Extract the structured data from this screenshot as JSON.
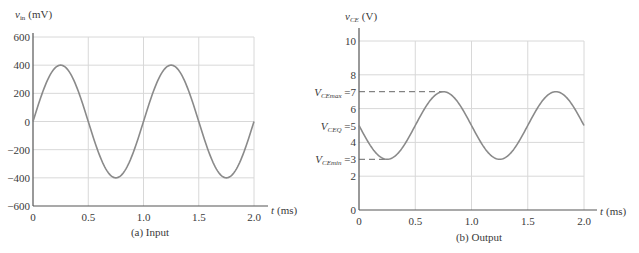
{
  "chart_data": [
    {
      "type": "line",
      "caption": "(a) Input",
      "ylabel": "v_in (mV)",
      "ylabel_main": "v",
      "ylabel_sub": "in",
      "ylabel_unit": "(mV)",
      "xlabel": "t (ms)",
      "xlabel_var": "t",
      "xlabel_unit": "(ms)",
      "xlim": [
        0,
        2.0
      ],
      "ylim": [
        -600,
        600
      ],
      "xticks": [
        "0",
        "0.5",
        "1.0",
        "1.5",
        "2.0"
      ],
      "yticks": [
        "600",
        "400",
        "200",
        "0",
        "−200",
        "−400",
        "−600"
      ],
      "grid": true,
      "series": [
        {
          "name": "v_in",
          "function": "400*sin(2*pi*t/1.0)",
          "amplitude": 400,
          "offset": 0,
          "period_ms": 1.0,
          "x": [
            0,
            0.25,
            0.5,
            0.75,
            1.0,
            1.25,
            1.5,
            1.75,
            2.0
          ],
          "y": [
            0,
            400,
            0,
            -400,
            0,
            400,
            0,
            -400,
            0
          ]
        }
      ]
    },
    {
      "type": "line",
      "caption": "(b) Output",
      "ylabel": "v_CE (V)",
      "ylabel_main": "v",
      "ylabel_sub": "CE",
      "ylabel_unit": "(V)",
      "xlabel": "t (ms)",
      "xlabel_var": "t",
      "xlabel_unit": "(ms)",
      "xlim": [
        0,
        2.0
      ],
      "ylim": [
        0,
        10
      ],
      "xticks": [
        "0",
        "0.5",
        "1.0",
        "1.5",
        "2.0"
      ],
      "yticks": [
        "10",
        "8",
        "6",
        "4",
        "2",
        "0"
      ],
      "grid": true,
      "annotations": [
        {
          "label": "V_CEmax = 7",
          "main": "V",
          "sub": "CEmax",
          "value": "7",
          "y": 7,
          "dashed_to_x": 0.75
        },
        {
          "label": "V_CEQ = 5",
          "main": "V",
          "sub": "CEQ",
          "value": "5",
          "y": 5
        },
        {
          "label": "V_CEmin = 3",
          "main": "V",
          "sub": "CEmin",
          "value": "3",
          "y": 3,
          "dashed_to_x": 0.25
        }
      ],
      "series": [
        {
          "name": "v_CE",
          "function": "5 - 2*sin(2*pi*t/1.0)",
          "amplitude": 2,
          "offset": 5,
          "period_ms": 1.0,
          "x": [
            0,
            0.25,
            0.5,
            0.75,
            1.0,
            1.25,
            1.5,
            1.75,
            2.0
          ],
          "y": [
            5,
            3,
            5,
            7,
            5,
            3,
            5,
            7,
            5
          ]
        }
      ]
    }
  ],
  "colors": {
    "curve": "#8a8a8a",
    "grid": "#d8d8d8",
    "axis": "#555555",
    "text": "#3a3a3a",
    "dash": "#666666"
  }
}
